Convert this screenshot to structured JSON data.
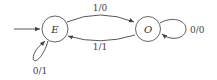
{
  "diagram": {
    "type": "finite-state-machine",
    "states": [
      {
        "id": "E",
        "label": "E",
        "initial": true
      },
      {
        "id": "O",
        "label": "O",
        "initial": false
      }
    ],
    "transitions": [
      {
        "from": "E",
        "to": "O",
        "label": "1/0"
      },
      {
        "from": "O",
        "to": "E",
        "label": "1/1"
      },
      {
        "from": "E",
        "to": "E",
        "label": "0/1"
      },
      {
        "from": "O",
        "to": "O",
        "label": "0/0"
      }
    ]
  }
}
